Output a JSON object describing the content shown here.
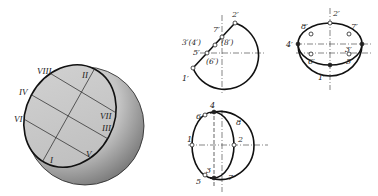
{
  "figure": {
    "colors": {
      "line": "#111111",
      "cut_face": "#c8c8c8",
      "sphere_light": "#e6e6e6",
      "sphere_dark": "#7a7a7a",
      "background": "#ffffff"
    }
  },
  "pictorial": {
    "labels": {
      "VIII": "VIII",
      "II": "II",
      "IV": "IV",
      "VI": "VI",
      "VII": "VII",
      "III": "III",
      "I": "I",
      "V": "V"
    }
  },
  "front_view": {
    "labels": {
      "p2": "2′",
      "p7": "7′",
      "p3_4": "3′(4′)",
      "p8": "(8′)",
      "p5": "5′",
      "p6": "(6′)",
      "p1": "1′"
    }
  },
  "top_view": {
    "labels": {
      "p2": "2′",
      "p8": "8′",
      "p7": "7′",
      "p4": "4′",
      "p3": "3′",
      "p6": "6′",
      "p5": "5′",
      "p1": "1′"
    }
  },
  "side_view": {
    "labels": {
      "p4": "4",
      "p6": "6",
      "p8": "8",
      "p1": "1",
      "p2": "2",
      "p3": "3",
      "p5": "5",
      "p7": "7"
    }
  }
}
